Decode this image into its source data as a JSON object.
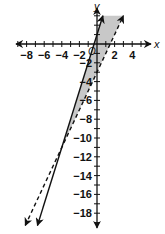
{
  "chart_data": {
    "type": "line",
    "title": "",
    "xlabel": "x",
    "ylabel": "y",
    "origin_label": "O",
    "xlim": [
      -9,
      5
    ],
    "ylim": [
      -20,
      4
    ],
    "grid": false,
    "x_ticks": [
      -8,
      -6,
      -4,
      -2,
      2,
      4
    ],
    "x_tick_labels": [
      "−8",
      "−6",
      "−4",
      "−2",
      "2",
      "4"
    ],
    "y_ticks": [
      -2,
      -4,
      -6,
      -8,
      -10,
      -12,
      -14,
      -16,
      -18
    ],
    "y_tick_labels": [
      "−2",
      "−4",
      "−6",
      "−8",
      "−10",
      "−12",
      "−14",
      "−16",
      "−18"
    ],
    "series": [
      {
        "name": "boundary-solid",
        "equation": "y = 3x + 1",
        "slope": 3,
        "intercept": 1,
        "style": "solid",
        "color": "#111111"
      },
      {
        "name": "boundary-dashed",
        "equation": "y = 2x - 3",
        "slope": 2,
        "intercept": -3,
        "style": "dashed",
        "color": "#111111"
      }
    ],
    "shaded_region": {
      "description": "Region between the two lines above their intersection: y <= 3x + 1 and y > 2x - 3",
      "intersection": [
        -4,
        -11
      ],
      "color": "#c8c8c8"
    }
  }
}
